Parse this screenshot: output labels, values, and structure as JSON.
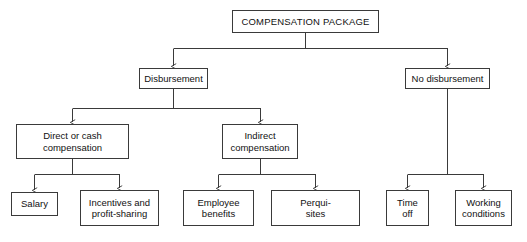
{
  "diagram": {
    "title": "COMPENSATION PACKAGE",
    "type": "hierarchy-tree",
    "background_color": "#ffffff",
    "line_color": "#3a3a3a",
    "text_color": "#111111",
    "nodes": {
      "root": {
        "label": "COMPENSATION PACKAGE"
      },
      "disbursement": {
        "label": "Disbursement"
      },
      "no_disbursement": {
        "label": "No disbursement"
      },
      "direct_or_cash": {
        "label": "Direct or cash\ncompensation"
      },
      "indirect": {
        "label": "Indirect\ncompensation"
      },
      "salary": {
        "label": "Salary"
      },
      "incentives": {
        "label": "Incentives and\nprofit-sharing"
      },
      "employee_benefits": {
        "label": "Employee\nbenefits"
      },
      "perquisites": {
        "label": "Perqui-\nsites"
      },
      "time_off": {
        "label": "Time\noff"
      },
      "working_conditions": {
        "label": "Working\nconditions"
      }
    },
    "edges": [
      {
        "from": "root",
        "to": "disbursement"
      },
      {
        "from": "root",
        "to": "no_disbursement"
      },
      {
        "from": "disbursement",
        "to": "direct_or_cash"
      },
      {
        "from": "disbursement",
        "to": "indirect"
      },
      {
        "from": "direct_or_cash",
        "to": "salary"
      },
      {
        "from": "direct_or_cash",
        "to": "incentives"
      },
      {
        "from": "indirect",
        "to": "employee_benefits"
      },
      {
        "from": "indirect",
        "to": "perquisites"
      },
      {
        "from": "no_disbursement",
        "to": "time_off"
      },
      {
        "from": "no_disbursement",
        "to": "working_conditions"
      }
    ]
  }
}
